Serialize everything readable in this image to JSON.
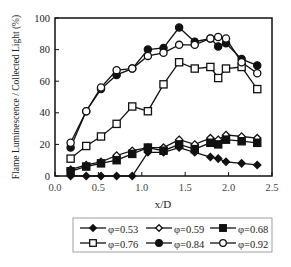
{
  "chart_data": {
    "type": "line",
    "title": "",
    "xlabel": "x/D",
    "ylabel": "Flame Luminescence / Collected Light (%)",
    "xlim": [
      0.0,
      2.5
    ],
    "ylim": [
      0,
      100
    ],
    "xticks": [
      "0.0",
      "0.5",
      "1.0",
      "1.5",
      "2.0",
      "2.5"
    ],
    "yticks": [
      "0",
      "20",
      "40",
      "60",
      "80",
      "100"
    ],
    "grid": false,
    "legend_position": "below",
    "series": [
      {
        "name": "φ=0.53",
        "marker": "filled-diamond",
        "x": [
          0.18,
          0.36,
          0.53,
          0.71,
          0.89,
          1.07,
          1.25,
          1.43,
          1.61,
          1.79,
          1.88,
          1.97,
          2.15,
          2.33
        ],
        "values": [
          0,
          0,
          0,
          0,
          0,
          15,
          15,
          18,
          15,
          12,
          11,
          9,
          8,
          7
        ]
      },
      {
        "name": "φ=0.59",
        "marker": "open-diamond",
        "x": [
          0.18,
          0.36,
          0.53,
          0.71,
          0.89,
          1.07,
          1.25,
          1.43,
          1.61,
          1.79,
          1.88,
          1.97,
          2.15,
          2.33
        ],
        "values": [
          4,
          7,
          9,
          13,
          16,
          18,
          18,
          23,
          20,
          24,
          23,
          26,
          25,
          24
        ]
      },
      {
        "name": "φ=0.68",
        "marker": "filled-square",
        "x": [
          0.18,
          0.36,
          0.53,
          0.71,
          0.89,
          1.07,
          1.25,
          1.43,
          1.61,
          1.79,
          1.88,
          1.97,
          2.15,
          2.33
        ],
        "values": [
          3,
          6,
          8,
          10,
          14,
          18,
          16,
          20,
          17,
          21,
          20,
          23,
          22,
          21
        ]
      },
      {
        "name": "φ=0.76",
        "marker": "open-square",
        "x": [
          0.18,
          0.36,
          0.53,
          0.71,
          0.89,
          1.07,
          1.25,
          1.43,
          1.61,
          1.79,
          1.88,
          1.97,
          2.15,
          2.33
        ],
        "values": [
          11,
          19,
          25,
          33,
          44,
          41,
          58,
          72,
          68,
          69,
          62,
          68,
          69,
          55
        ]
      },
      {
        "name": "φ=0.84",
        "marker": "filled-circle",
        "x": [
          0.18,
          0.36,
          0.53,
          0.71,
          0.89,
          1.07,
          1.25,
          1.43,
          1.61,
          1.79,
          1.88,
          1.97,
          2.15,
          2.33
        ],
        "values": [
          18,
          41,
          55,
          64,
          68,
          80,
          81,
          94,
          85,
          87,
          82,
          84,
          74,
          70
        ]
      },
      {
        "name": "φ=0.92",
        "marker": "open-circle",
        "x": [
          0.18,
          0.36,
          0.53,
          0.71,
          0.89,
          1.07,
          1.25,
          1.43,
          1.61,
          1.79,
          1.88,
          1.97,
          2.15,
          2.33
        ],
        "values": [
          21,
          41,
          56,
          67,
          68,
          76,
          78,
          83,
          83,
          87,
          88,
          87,
          72,
          65
        ]
      }
    ]
  }
}
